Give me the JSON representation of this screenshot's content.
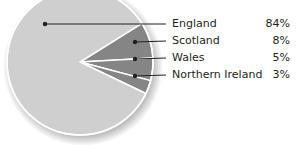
{
  "chart_data": {
    "type": "pie",
    "title": "",
    "categories": [
      "England",
      "Scotland",
      "Wales",
      "Northern Ireland"
    ],
    "values": [
      84,
      8,
      5,
      3
    ],
    "value_labels": [
      "84%",
      "8%",
      "5%",
      "3%"
    ],
    "colors": [
      "#cfcfcf",
      "#858585",
      "#858585",
      "#858585"
    ],
    "legend_position": "right",
    "unit": "%"
  },
  "labels": [
    {
      "name": "England",
      "pct": "84%"
    },
    {
      "name": "Scotland",
      "pct": "8%"
    },
    {
      "name": "Wales",
      "pct": "5%"
    },
    {
      "name": "Northern Ireland",
      "pct": "3%"
    }
  ],
  "colors": {
    "major_slice": "#cfcfcf",
    "minor_slice": "#858585",
    "slice_border": "#ffffff",
    "leader_line": "#231f20",
    "text": "#231f20"
  }
}
